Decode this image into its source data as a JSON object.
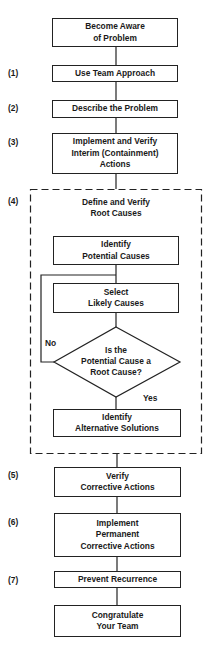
{
  "diagram": {
    "start": "Become Aware\nof Problem",
    "steps": [
      {
        "number": "(1)",
        "label": "Use Team Approach"
      },
      {
        "number": "(2)",
        "label": "Describe the Problem"
      },
      {
        "number": "(3)",
        "label": "Implement and Verify\nInterim (Containment)\nActions"
      },
      {
        "number": "(4)",
        "label": "Define and Verify\nRoot Causes"
      },
      {
        "number": "(5)",
        "label": "Verify\nCorrective Actions"
      },
      {
        "number": "(6)",
        "label": "Implement\nPermanent\nCorrective Actions"
      },
      {
        "number": "(7)",
        "label": "Prevent Recurrence"
      }
    ],
    "substeps": {
      "identify_potential": "Identify\nPotential Causes",
      "select_likely": "Select\nLikely Causes",
      "decision": "Is the\nPotential Cause a\nRoot Cause?",
      "decision_no": "No",
      "decision_yes": "Yes",
      "identify_alternatives": "Identify\nAlternative Solutions"
    },
    "end": "Congratulate\nYour Team",
    "colors": {
      "line": "#222222",
      "background": "#ffffff"
    }
  }
}
